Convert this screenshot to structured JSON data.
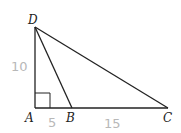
{
  "diagram": {
    "type": "geometry-triangle",
    "points": {
      "D": {
        "label": "D",
        "x": 35,
        "y": 27
      },
      "A": {
        "label": "A",
        "x": 35,
        "y": 108
      },
      "B": {
        "label": "B",
        "x": 72,
        "y": 108
      },
      "C": {
        "label": "C",
        "x": 168,
        "y": 108
      }
    },
    "segments": [
      "DA",
      "AC",
      "DB",
      "DC"
    ],
    "right_angle_at": "A",
    "measurements": {
      "DA": "10",
      "AB": "5",
      "BC": "15"
    },
    "colors": {
      "line": "#222222",
      "handwriting": "#b8b8b8"
    }
  }
}
